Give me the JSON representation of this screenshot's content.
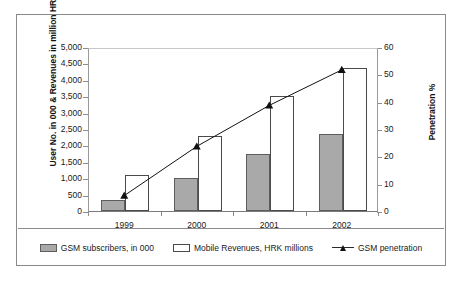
{
  "chart_data": {
    "type": "bar",
    "title": "",
    "subtitle": "",
    "categories": [
      "1999",
      "2000",
      "2001",
      "2002"
    ],
    "xlabel": "",
    "ylabel": "User No. in 000 & Revenues in million HRI",
    "ylabel_secondary": "Penetration %",
    "ylim": [
      0,
      5000
    ],
    "ylim_secondary": [
      0,
      60
    ],
    "ytick_step": 500,
    "ytick_step_secondary": 10,
    "yticks": [
      "5,000",
      "4,500",
      "4,000",
      "3,500",
      "3,000",
      "2,500",
      "2,000",
      "1,500",
      "1,000",
      "500",
      "0"
    ],
    "ytick_values": [
      5000,
      4500,
      4000,
      3500,
      3000,
      2500,
      2000,
      1500,
      1000,
      500,
      0
    ],
    "yticks_secondary": [
      "60",
      "50",
      "40",
      "30",
      "20",
      "10",
      "0"
    ],
    "ytick_values_secondary": [
      60,
      50,
      40,
      30,
      20,
      10,
      0
    ],
    "grid": false,
    "legend_position": "bottom",
    "series": [
      {
        "name": "GSM subscribers, in 000",
        "type": "bar",
        "axis": "left",
        "color": "#a9a9a9",
        "border": "#5d5d5d",
        "values": [
          350,
          1000,
          1750,
          2350
        ]
      },
      {
        "name": "Mobile Revenues, HRK millions",
        "type": "bar",
        "axis": "left",
        "color": "#ffffff",
        "border": "#4a4a4a",
        "values": [
          1100,
          2300,
          3500,
          4350
        ]
      },
      {
        "name": "GSM penetration",
        "type": "line",
        "axis": "right",
        "color": "#111111",
        "marker": "triangle",
        "values": [
          6,
          24,
          39,
          52
        ]
      }
    ]
  }
}
